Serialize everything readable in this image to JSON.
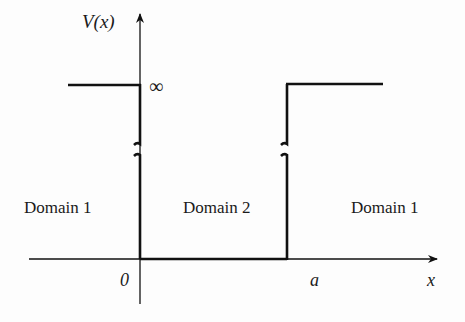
{
  "diagram": {
    "y_axis_label": "V(x)",
    "x_axis_label": "x",
    "origin_label": "0",
    "wall_position_label": "a",
    "infinity_label": "∞",
    "regions": [
      {
        "id": "left",
        "label": "Domain 1"
      },
      {
        "id": "middle",
        "label": "Domain 2"
      },
      {
        "id": "right",
        "label": "Domain 1"
      }
    ],
    "line_color": "#111111"
  }
}
